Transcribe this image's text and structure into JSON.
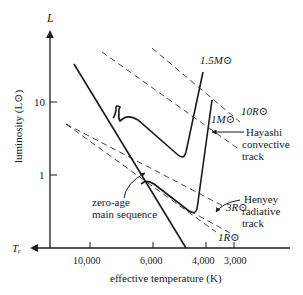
{
  "diagram": {
    "type": "Hertzsprung-Russell pre-main-sequence evolutionary tracks",
    "y_axis": {
      "symbol": "L",
      "label": "luminosity (L⊙)",
      "ticks": [
        "10",
        "1"
      ]
    },
    "x_axis": {
      "symbol": "Tₑ",
      "label": "effective temperature (K)",
      "ticks": [
        "10,000",
        "6,000",
        "4,000",
        "3,000"
      ]
    },
    "radius_lines": [
      {
        "label": "10R⊙"
      },
      {
        "label": "3R⊙"
      },
      {
        "label": "1R⊙"
      }
    ],
    "tracks": [
      {
        "label": "1.5M⊙"
      },
      {
        "label": "1M⊙"
      }
    ],
    "annotations": {
      "zams_line1": "zero-age",
      "zams_line2": "main sequence",
      "hayashi_line1": "Hayashi",
      "hayashi_line2": "convective",
      "hayashi_line3": "track",
      "henyey_line1": "Henyey",
      "henyey_line2": "radiative",
      "henyey_line3": "track"
    },
    "colors": {
      "ink": "#1a1a1a",
      "background": "#ffffff"
    }
  }
}
